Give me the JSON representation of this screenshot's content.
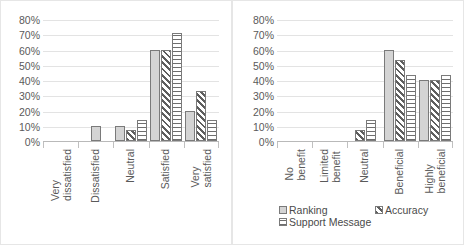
{
  "legend": {
    "position": "bottom",
    "items": [
      {
        "label": "Ranking",
        "pattern": "solid-gray"
      },
      {
        "label": "Accuracy",
        "pattern": "diagonal-hatch"
      },
      {
        "label": "Support Message",
        "pattern": "horizontal-hatch"
      }
    ]
  },
  "axis": {
    "ticks": [
      "80%",
      "70%",
      "60%",
      "50%",
      "40%",
      "30%",
      "20%",
      "10%",
      "0%"
    ]
  },
  "chart_data": [
    {
      "type": "bar",
      "title": "",
      "xlabel": "",
      "ylabel": "",
      "ylim": [
        0,
        80
      ],
      "ytick_values": [
        0,
        10,
        20,
        30,
        40,
        50,
        60,
        70,
        80
      ],
      "ytick_labels": [
        "0%",
        "10%",
        "20%",
        "30%",
        "40%",
        "50%",
        "60%",
        "70%",
        "80%"
      ],
      "grid": true,
      "categories": [
        "Very dissatisfied",
        "Dissatisfied",
        "Neutral",
        "Satisfied",
        "Very satisfied"
      ],
      "series": [
        {
          "name": "Ranking",
          "values": [
            0,
            10,
            10,
            60,
            20
          ]
        },
        {
          "name": "Accuracy",
          "values": [
            0,
            0,
            7,
            60,
            33
          ]
        },
        {
          "name": "Support Message",
          "values": [
            0,
            0,
            14,
            71,
            14
          ]
        }
      ]
    },
    {
      "type": "bar",
      "title": "",
      "xlabel": "",
      "ylabel": "",
      "ylim": [
        0,
        80
      ],
      "ytick_values": [
        0,
        10,
        20,
        30,
        40,
        50,
        60,
        70,
        80
      ],
      "ytick_labels": [
        "0%",
        "10%",
        "20%",
        "30%",
        "40%",
        "50%",
        "60%",
        "70%",
        "80%"
      ],
      "grid": true,
      "categories": [
        "No benefit",
        "Limited benefit",
        "Neutral",
        "Beneficial",
        "Highly beneficial"
      ],
      "series": [
        {
          "name": "Ranking",
          "values": [
            0,
            0,
            0,
            60,
            40
          ]
        },
        {
          "name": "Accuracy",
          "values": [
            0,
            0,
            7,
            53,
            40
          ]
        },
        {
          "name": "Support Message",
          "values": [
            0,
            0,
            14,
            43,
            43
          ]
        }
      ]
    }
  ]
}
